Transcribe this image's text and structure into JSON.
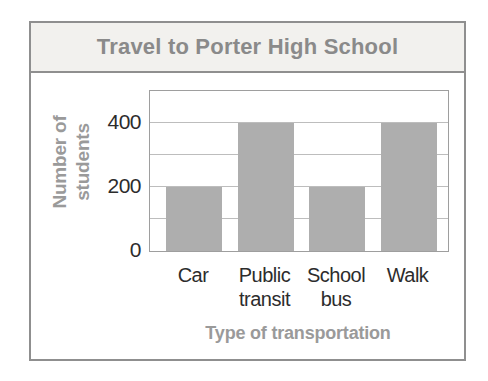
{
  "chart_data": {
    "type": "bar",
    "title": "Travel to Porter High School",
    "categories": [
      "Car",
      "Public transit",
      "School bus",
      "Walk"
    ],
    "values": [
      200,
      400,
      200,
      400
    ],
    "xlabel": "Type of transportation",
    "ylabel": "Number of students",
    "ylabel_lines": [
      "Number of",
      "students"
    ],
    "ylim": [
      0,
      500
    ],
    "yticks": [
      0,
      200,
      400
    ],
    "grid_step": 100,
    "grid": "horizontal",
    "legend": "none",
    "bar_color": "#aeaeae"
  },
  "colors": {
    "card_border": "#8f8f8f",
    "header_bg": "#f2f1ee",
    "title_text": "#8a8a8a",
    "axis_title_text": "#9a9a9a",
    "tick_text": "#2c2c2c",
    "plot_border": "#9e9e9e",
    "gridline": "#bdbdbd",
    "bar_fill": "#aeaeae"
  }
}
